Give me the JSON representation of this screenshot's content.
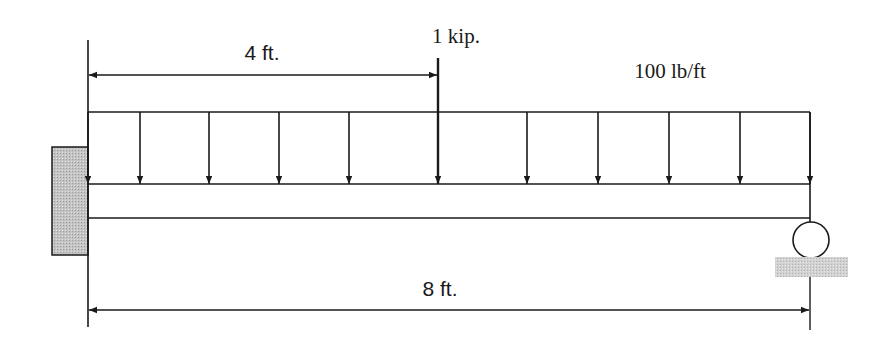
{
  "diagram": {
    "type": "beam-loading",
    "labels": {
      "point_load": "1 kip.",
      "distributed_load": "100 lb/ft",
      "dim_short": "4 ft.",
      "dim_total": "8 ft."
    },
    "beam": {
      "length_ft": 8,
      "left_support": "fixed",
      "right_support": "roller"
    },
    "point_load": {
      "magnitude": "1 kip",
      "position_ft": 4
    },
    "distributed_load": {
      "magnitude": "100 lb/ft",
      "from_ft": 0,
      "to_ft": 8
    },
    "distributed_arrow_x": [
      88,
      140,
      209,
      279,
      349,
      527,
      598,
      669,
      740,
      810
    ],
    "colors": {
      "line": "#1a1a1a",
      "wall_fill": "#bdbdbd",
      "ground_fill": "#c8c8c8"
    }
  }
}
